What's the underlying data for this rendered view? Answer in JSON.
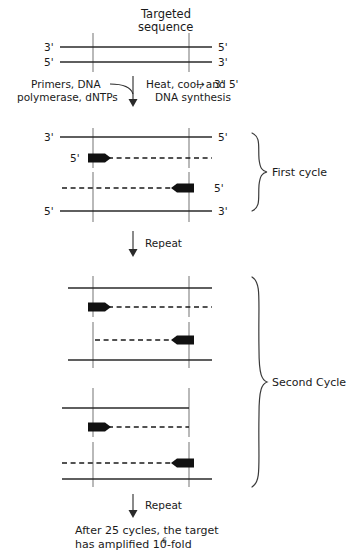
{
  "figure": {
    "title": "Targeted sequence",
    "title_line1": "Targeted",
    "title_line2": "sequence",
    "colors": {
      "strand": "#2a2a2a",
      "marker": "#8a8a8a",
      "primer": "#111111",
      "text": "#1a1a1a",
      "background": "#ffffff"
    }
  },
  "primes": {
    "three": "3'",
    "five": "5'"
  },
  "template_duplex": {
    "top_left_label": "3'",
    "top_right_label": "5'",
    "bottom_left_label": "5'",
    "bottom_right_label": "3'"
  },
  "reaction_step": {
    "reagents_line1": "Primers, DNA",
    "reagents_line2": "polymerase, dNTPs",
    "conditions_line1_pre": "Heat, cool, and 5'",
    "conditions_line1_arrow": "→",
    "conditions_line1_post": "3'",
    "conditions_line2": "DNA synthesis"
  },
  "first_cycle": {
    "brace_label": "First cycle",
    "strands": [
      {
        "left_label": "3'",
        "right_label": "5'",
        "type": "solid"
      },
      {
        "left_label": "5'",
        "right_label": "",
        "type": "dashed",
        "primer": "left"
      },
      {
        "left_label": "",
        "right_label": "5'",
        "type": "dashed",
        "primer": "right"
      },
      {
        "left_label": "5'",
        "right_label": "3'",
        "type": "solid"
      }
    ]
  },
  "repeat_steps": {
    "first": "Repeat",
    "second": "Repeat"
  },
  "second_cycle": {
    "brace_label": "Second Cycle",
    "groups": [
      {
        "strands": [
          {
            "type": "solid"
          },
          {
            "type": "dashed",
            "primer": "left"
          },
          {
            "type": "dashed",
            "primer": "right"
          },
          {
            "type": "solid"
          }
        ]
      },
      {
        "strands": [
          {
            "type": "solid"
          },
          {
            "type": "dashed",
            "primer": "left"
          },
          {
            "type": "dashed",
            "primer": "right"
          },
          {
            "type": "solid"
          }
        ]
      }
    ]
  },
  "conclusion": {
    "line1": "After 25 cycles, the target",
    "line2_pre": "has amplified 10",
    "line2_sup": "6",
    "line2_post": "-fold"
  }
}
